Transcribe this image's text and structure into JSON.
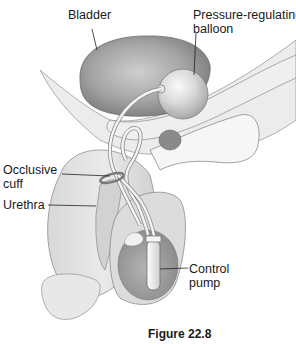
{
  "figure": {
    "caption": "Figure 22.8",
    "labels": {
      "bladder": "Bladder",
      "balloon": "Pressure-regulating\nballoon",
      "cuff": "Occlusive\ncuff",
      "urethra": "Urethra",
      "pump": "Control\npump"
    },
    "colors": {
      "background": "#ffffff",
      "bladder": "#8f8f8f",
      "tissue": "#e2e2e2",
      "outline": "#6e6e6e",
      "text": "#1a1a1a"
    }
  }
}
